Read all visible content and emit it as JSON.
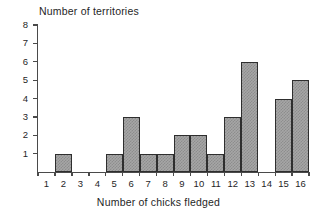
{
  "chart_data": {
    "type": "bar",
    "title": "",
    "xlabel": "Number of chicks fledged",
    "ylabel": "Number of territories",
    "categories": [
      "1",
      "2",
      "3",
      "4",
      "5",
      "6",
      "7",
      "8",
      "9",
      "10",
      "11",
      "12",
      "13",
      "14",
      "15",
      "16"
    ],
    "values": [
      0,
      1,
      0,
      0,
      1,
      3,
      1,
      1,
      2,
      2,
      1,
      3,
      6,
      0,
      4,
      5
    ],
    "ylim": [
      0,
      8
    ],
    "ytick_labels": [
      "1",
      "2",
      "3",
      "4",
      "5",
      "6",
      "7",
      "8"
    ],
    "ytick_values": [
      1,
      2,
      3,
      4,
      5,
      6,
      7,
      8
    ],
    "xtick_labels": [
      "1",
      "2",
      "3",
      "4",
      "5",
      "6",
      "7",
      "8",
      "9",
      "10",
      "11",
      "12",
      "13",
      "14",
      "15",
      "16"
    ],
    "grid": false,
    "legend": null,
    "bar_fill_color": "#a6a6a6",
    "bar_edge_color": "#2e2e2e",
    "axis_color": "#4a4a4a",
    "background_color": "#ffffff"
  },
  "axes": {
    "y_axis_title": "Number of territories",
    "x_axis_title": "Number of chicks fledged"
  }
}
